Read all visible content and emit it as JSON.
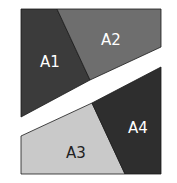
{
  "diagram": {
    "regions": [
      {
        "id": "A1",
        "label": "A1",
        "fill": "#3b3b3b",
        "text_color": "#ffffff"
      },
      {
        "id": "A2",
        "label": "A2",
        "fill": "#6e6e6e",
        "text_color": "#ffffff"
      },
      {
        "id": "A3",
        "label": "A3",
        "fill": "#c9c9c9",
        "text_color": "#222222"
      },
      {
        "id": "A4",
        "label": "A4",
        "fill": "#2e2e2e",
        "text_color": "#ffffff"
      }
    ],
    "separator_color": "#ffffff",
    "border_color": "#1a1a1a"
  }
}
